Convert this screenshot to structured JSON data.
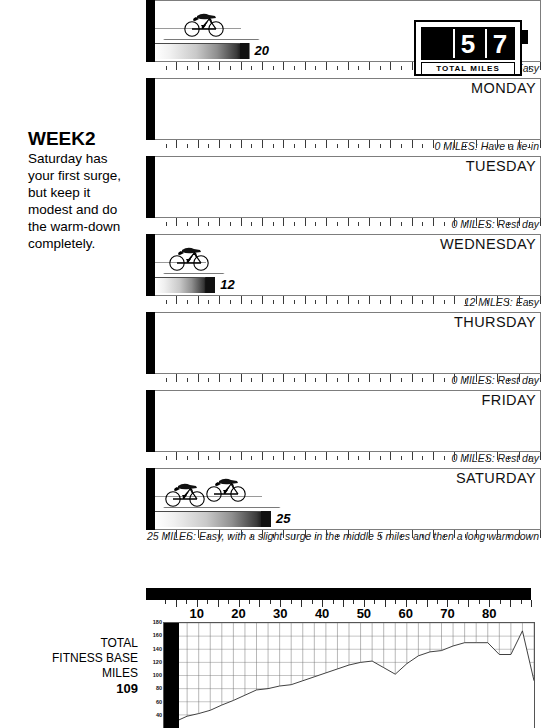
{
  "sidebar": {
    "week_title": "WEEK2",
    "week_description": "Saturday has your first surge, but keep it modest and do the warm-down completely.",
    "total_label_line1": "TOTAL",
    "total_label_line2": "FITNESS BASE",
    "total_label_line3": "MILES",
    "total_value": "109"
  },
  "counter": {
    "digit_blank": "",
    "digit_tens": "5",
    "digit_ones": "7",
    "label": "TOTAL MILES"
  },
  "days": [
    {
      "name": "",
      "miles": 20,
      "miles_display": "20",
      "caption": "20 MILES:  Easy",
      "cyclists": 1,
      "show_day_name": false
    },
    {
      "name": "MONDAY",
      "miles": 0,
      "miles_display": "",
      "caption": "0 MILES: Have a lie-in",
      "cyclists": 0,
      "show_day_name": true
    },
    {
      "name": "TUESDAY",
      "miles": 0,
      "miles_display": "",
      "caption": "0 MILES: Rest day",
      "cyclists": 0,
      "show_day_name": true
    },
    {
      "name": "WEDNESDAY",
      "miles": 12,
      "miles_display": "12",
      "caption": "12 MILES:  Easy",
      "cyclists": 1,
      "show_day_name": true
    },
    {
      "name": "THURSDAY",
      "miles": 0,
      "miles_display": "",
      "caption": "0 MILES: Rest day",
      "cyclists": 0,
      "show_day_name": true
    },
    {
      "name": "FRIDAY",
      "miles": 0,
      "miles_display": "",
      "caption": "0 MILES: Rest day",
      "cyclists": 0,
      "show_day_name": true
    },
    {
      "name": "SATURDAY",
      "miles": 25,
      "miles_display": "25",
      "caption": "25 MILES:  Easy, with a  slight surge in the middle 5 miles and then a long warmdown",
      "cyclists": 2,
      "show_day_name": true
    }
  ],
  "scale": {
    "ticks": [
      10,
      20,
      30,
      40,
      50,
      60,
      70,
      80
    ],
    "max": 90,
    "labels": [
      "10",
      "20",
      "30",
      "40",
      "50",
      "60",
      "70",
      "80"
    ]
  },
  "chart_data": {
    "type": "area",
    "title": "",
    "xlabel": "",
    "ylabel": "",
    "ylim": [
      20,
      180
    ],
    "yticks": [
      40,
      60,
      80,
      100,
      120,
      140,
      160,
      180
    ],
    "ytick_labels": [
      "40",
      "60",
      "80",
      "100",
      "120",
      "140",
      "160",
      "180"
    ],
    "grid": true,
    "legend": "none",
    "x": [
      0,
      1,
      2,
      3,
      4,
      5,
      6,
      7,
      8,
      9,
      10,
      11,
      12,
      13,
      14,
      15,
      16,
      17,
      18,
      19,
      20,
      21,
      22,
      23,
      24,
      25,
      26,
      27,
      28,
      29,
      30,
      31,
      32
    ],
    "values": [
      22,
      30,
      38,
      42,
      47,
      55,
      62,
      70,
      78,
      80,
      84,
      86,
      92,
      98,
      104,
      110,
      116,
      120,
      122,
      112,
      102,
      118,
      130,
      136,
      138,
      145,
      150,
      150,
      150,
      132,
      132,
      168,
      92
    ]
  }
}
